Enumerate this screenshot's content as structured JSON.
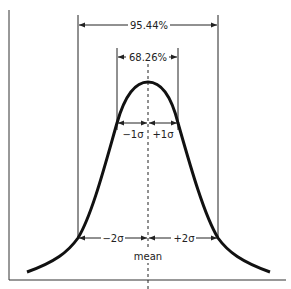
{
  "diagram": {
    "type": "normal-distribution",
    "labels": {
      "two_sigma_pct": "95.44%",
      "one_sigma_pct": "68.26%",
      "minus_one_sigma": "−1σ",
      "plus_one_sigma": "+1σ",
      "minus_two_sigma": "−2σ",
      "plus_two_sigma": "+2σ",
      "mean": "mean"
    },
    "colors": {
      "curve": "#111111",
      "lines": "#222222",
      "background": "#ffffff"
    }
  }
}
